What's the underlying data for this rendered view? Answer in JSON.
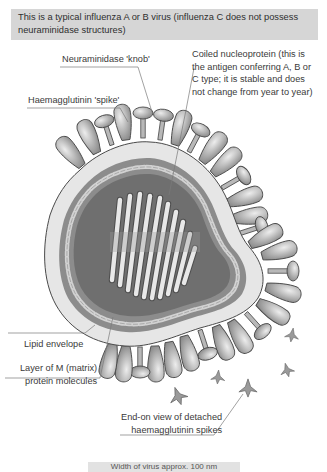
{
  "caption": {
    "text": "This is a typical influenza A or B virus (influenza C does not possess neuraminidase structures)"
  },
  "labels": {
    "neuraminidase": "Neuraminidase 'knob'",
    "haemagglutinin": "Haemagglutinin 'spike'",
    "nucleoprotein": [
      "Coiled nucleoprotein (this is",
      "the antigen conferring A, B or",
      "C type; it is stable and does",
      "not change from year to year)"
    ],
    "lipid_envelope": "Lipid envelope",
    "matrix": [
      "Layer of M (matrix)",
      "protein molecules"
    ],
    "detached_spikes": [
      "End-on view of detached",
      "haemagglutinin spikes"
    ]
  },
  "scale_bar": {
    "text": "Width of virus approx. 100 nm"
  },
  "colors": {
    "caption_bg": "#d6d6d6",
    "envelope": "#e6e6e6",
    "matrix_layer": "#8c8c8c",
    "core": "#6e6e6e",
    "spike": "#b4b4b4",
    "leader_line": "#7a7a7a"
  }
}
